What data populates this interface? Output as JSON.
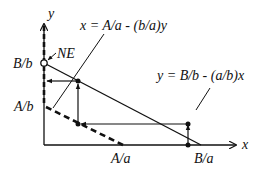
{
  "diagram": {
    "axes": {
      "x_label": "x",
      "y_label": "y"
    },
    "labels": {
      "B_over_b": "B/b",
      "A_over_b": "A/b",
      "A_over_a": "A/a",
      "B_over_a": "B/a",
      "ne": "NE",
      "eq_x": "x = A/a - (b/a)y",
      "eq_y": "y = B/b - (a/b)x"
    },
    "colors": {
      "ink": "#111111",
      "background": "#ffffff"
    }
  }
}
